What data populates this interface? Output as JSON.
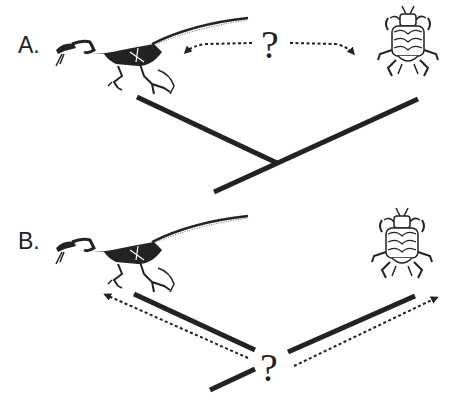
{
  "figure": {
    "colors": {
      "ink": "#222222",
      "background": "#ffffff"
    },
    "panels": [
      {
        "label": "A.",
        "question": "?",
        "taxa": [
          {
            "name": "dinosaur",
            "icon": "raptor-skeleton-icon"
          },
          {
            "name": "louse",
            "icon": "louse-icon"
          }
        ],
        "tree": "single tree joining both taxa, with dotted bidirectional arrows through the question mark between the taxa"
      },
      {
        "label": "B.",
        "question": "?",
        "taxa": [
          {
            "name": "dinosaur",
            "icon": "raptor-skeleton-icon"
          },
          {
            "name": "louse",
            "icon": "louse-icon"
          }
        ],
        "tree": "two separate branches diverging from a question mark at the base, with dotted arrows pointing up to each taxon"
      }
    ]
  }
}
